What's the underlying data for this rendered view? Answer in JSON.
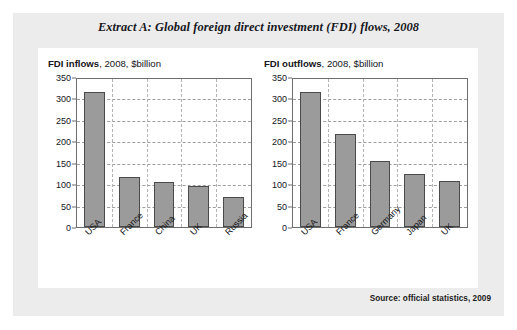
{
  "document": {
    "extract_title": "Extract A: Global foreign direct investment (FDI) flows, 2008",
    "source_note": "Source: official statistics, 2009"
  },
  "style": {
    "panel_bg": "#ececec",
    "card_bg": "#ffffff",
    "bar_fill": "#9b9b9b",
    "bar_border": "#4a4a4a",
    "axis_color": "#6e6e6e",
    "grid_color": "#9d9d9d",
    "text_color": "#15151a"
  },
  "chart_data": [
    {
      "id": "fdi-inflows",
      "type": "bar",
      "title_bold": "FDI inflows",
      "title_rest": ", 2008, $billion",
      "title": "FDI inflows, 2008, $billion",
      "xlabel": "",
      "ylabel": "",
      "ylim": [
        0,
        350
      ],
      "yticks": [
        0,
        50,
        100,
        150,
        200,
        250,
        300,
        350
      ],
      "grid": true,
      "legend": "none",
      "categories": [
        "USA",
        "France",
        "China",
        "UK",
        "Russia"
      ],
      "values": [
        314,
        116,
        106,
        95,
        69
      ]
    },
    {
      "id": "fdi-outflows",
      "type": "bar",
      "title_bold": "FDI outflows",
      "title_rest": ", 2008, $billion",
      "title": "FDI outflows, 2008, $billion",
      "xlabel": "",
      "ylabel": "",
      "ylim": [
        0,
        350
      ],
      "yticks": [
        0,
        50,
        100,
        150,
        200,
        250,
        300,
        350
      ],
      "grid": true,
      "legend": "none",
      "categories": [
        "USA",
        "France",
        "Germany",
        "Japan",
        "UK"
      ],
      "values": [
        314,
        216,
        154,
        123,
        107
      ]
    }
  ]
}
